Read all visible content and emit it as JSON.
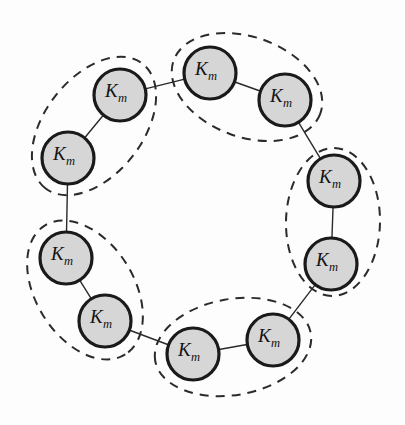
{
  "figure": {
    "name": "ring-of-clusters-diagram",
    "type": "graph-diagram",
    "background_color": "#fdfdfd",
    "width": 405,
    "height": 425
  },
  "style": {
    "node_fill": "#d6d6d6",
    "node_stroke": "#1a1a1a",
    "node_stroke_width": 3.2,
    "node_radius": 26,
    "node_label_size": 19,
    "edge_stroke": "#2a2a2a",
    "edge_stroke_width": 1.4,
    "group_stroke": "#2b2b2b",
    "group_stroke_width": 2.0,
    "group_dash": "9 7"
  },
  "labels": {
    "node_main": "K",
    "node_subscript": "m"
  },
  "nodes": [
    {
      "id": "n1",
      "label_main": "K",
      "label_sub": "m",
      "cx": 210,
      "cy": 73,
      "r": 26
    },
    {
      "id": "n2",
      "label_main": "K",
      "label_sub": "m",
      "cx": 285,
      "cy": 100,
      "r": 26
    },
    {
      "id": "n3",
      "label_main": "K",
      "label_sub": "m",
      "cx": 334,
      "cy": 181,
      "r": 26
    },
    {
      "id": "n4",
      "label_main": "K",
      "label_sub": "m",
      "cx": 331,
      "cy": 264,
      "r": 26
    },
    {
      "id": "n5",
      "label_main": "K",
      "label_sub": "m",
      "cx": 273,
      "cy": 340,
      "r": 26
    },
    {
      "id": "n6",
      "label_main": "K",
      "label_sub": "m",
      "cx": 193,
      "cy": 354,
      "r": 26
    },
    {
      "id": "n7",
      "label_main": "K",
      "label_sub": "m",
      "cx": 105,
      "cy": 321,
      "r": 26
    },
    {
      "id": "n8",
      "label_main": "K",
      "label_sub": "m",
      "cx": 66,
      "cy": 258,
      "r": 26
    },
    {
      "id": "n9",
      "label_main": "K",
      "label_sub": "m",
      "cx": 68,
      "cy": 158,
      "r": 26
    },
    {
      "id": "n10",
      "label_main": "K",
      "label_sub": "m",
      "cx": 120,
      "cy": 95,
      "r": 26
    }
  ],
  "edges": [
    {
      "id": "e1",
      "from": "n1",
      "to": "n2"
    },
    {
      "id": "e2",
      "from": "n2",
      "to": "n3"
    },
    {
      "id": "e3",
      "from": "n3",
      "to": "n4"
    },
    {
      "id": "e4",
      "from": "n4",
      "to": "n5"
    },
    {
      "id": "e5",
      "from": "n5",
      "to": "n6"
    },
    {
      "id": "e6",
      "from": "n6",
      "to": "n7"
    },
    {
      "id": "e7",
      "from": "n7",
      "to": "n8"
    },
    {
      "id": "e8",
      "from": "n8",
      "to": "n9"
    },
    {
      "id": "e9",
      "from": "n9",
      "to": "n10"
    },
    {
      "id": "e10",
      "from": "n10",
      "to": "n1"
    }
  ],
  "groups": [
    {
      "id": "g1",
      "members": [
        "n1",
        "n2"
      ],
      "cx": 247,
      "cy": 87,
      "rx": 78,
      "ry": 50,
      "rotation": 20
    },
    {
      "id": "g2",
      "members": [
        "n3",
        "n4"
      ],
      "cx": 333,
      "cy": 222,
      "rx": 74,
      "ry": 47,
      "rotation": 91
    },
    {
      "id": "g3",
      "members": [
        "n5",
        "n6"
      ],
      "cx": 233,
      "cy": 347,
      "rx": 79,
      "ry": 48,
      "rotation": 170
    },
    {
      "id": "g4",
      "members": [
        "n7",
        "n8"
      ],
      "cx": 85,
      "cy": 290,
      "rx": 76,
      "ry": 49,
      "rotation": 58
    },
    {
      "id": "g5",
      "members": [
        "n9",
        "n10"
      ],
      "cx": 94,
      "cy": 126,
      "rx": 79,
      "ry": 49,
      "rotation": 128
    }
  ]
}
